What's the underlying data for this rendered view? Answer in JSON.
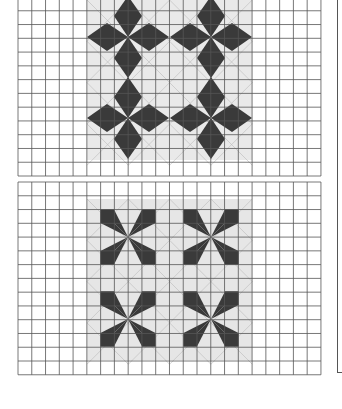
{
  "document": {
    "type": "quilt block pattern sheet",
    "figures": [
      {
        "id": "top",
        "description": "Four-petal kite flower blocks on grid paper",
        "grid": {
          "x": 18,
          "y": -3,
          "cols": 22,
          "rows": 13,
          "cell": 13.77
        },
        "shaded_region": {
          "x": 87,
          "y": 0,
          "w": 165,
          "h": 160
        },
        "flower_centers": [
          [
            128,
            37
          ],
          [
            211,
            37
          ],
          [
            128,
            118
          ],
          [
            211,
            118
          ]
        ],
        "petal_style": "kite",
        "colors": {
          "petal": "#3a3a3a",
          "shade": "#e9e9e9",
          "grid": "#555555"
        }
      },
      {
        "id": "bottom",
        "description": "Pinwheel star blocks on grid paper",
        "grid": {
          "x": 18,
          "y": 182,
          "cols": 22,
          "rows": 14,
          "cell": 13.77
        },
        "shaded_region": {
          "x": 87,
          "y": 199,
          "w": 165,
          "h": 161
        },
        "flower_centers": [
          [
            128,
            237
          ],
          [
            211,
            237
          ],
          [
            128,
            319
          ],
          [
            211,
            319
          ]
        ],
        "petal_style": "pinwheel",
        "colors": {
          "petal": "#3a3a3a",
          "shade": "#e6e6e6",
          "grid": "#555555"
        }
      }
    ],
    "footer_text": ""
  }
}
